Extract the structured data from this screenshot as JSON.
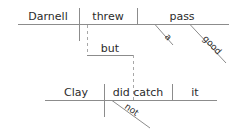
{
  "diagram": {
    "kind": "reed-kellogg-sentence-diagram",
    "sentence": "Darnell threw a good pass but Clay did not catch it",
    "line_color": "#8c8c8c",
    "text_color": "#2b2b2b",
    "dashed_color": "#a8a8a8",
    "clauses": [
      {
        "name": "main-clause-top",
        "subject": "Darnell",
        "verb": "threw",
        "direct_object": "pass",
        "modifiers": [
          {
            "word": "a",
            "type": "article",
            "modifies": "pass"
          },
          {
            "word": "good",
            "type": "adjective",
            "modifies": "pass"
          }
        ]
      },
      {
        "name": "main-clause-bottom",
        "subject": "Clay",
        "verb": "did catch",
        "direct_object": "it",
        "modifiers": [
          {
            "word": "not",
            "type": "adverb",
            "modifies": "did catch"
          }
        ]
      }
    ],
    "conjunction": {
      "word": "but",
      "type": "coordinating-conjunction"
    },
    "words": {
      "darnell": "Darnell",
      "threw": "threw",
      "pass": "pass",
      "a": "a",
      "good": "good",
      "but": "but",
      "clay": "Clay",
      "did_catch": "did catch",
      "it": "it",
      "not": "not"
    }
  }
}
